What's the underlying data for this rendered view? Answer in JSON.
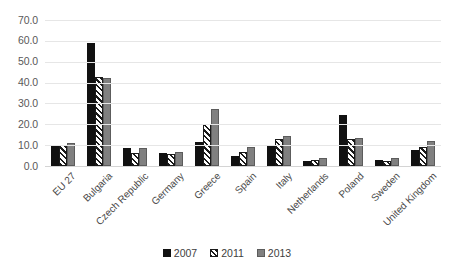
{
  "chart_data": {
    "type": "bar",
    "title": "",
    "subtitle": "",
    "xlabel": "",
    "ylabel": "",
    "ylim": [
      0,
      70
    ],
    "ytick_step": 10,
    "ytick_labels": [
      "70.0",
      "60.0",
      "50.0",
      "40.0",
      "30.0",
      "20.0",
      "10.0",
      "0.0"
    ],
    "grid": true,
    "legend_position": "bottom",
    "categories": [
      "EU 27",
      "Bulgaria",
      "Czech Republic",
      "Germany",
      "Greece",
      "Spain",
      "Italy",
      "Netherlands",
      "Poland",
      "Sweden",
      "United Kingdom"
    ],
    "series": [
      {
        "name": "2007",
        "color": "#111111",
        "pattern": "solid",
        "values": [
          10.3,
          58.8,
          8.5,
          6.4,
          11.5,
          5.0,
          10.0,
          2.4,
          24.5,
          3.0,
          7.5
        ]
      },
      {
        "name": "2011",
        "color": "#ffffff",
        "pattern": "diagonal-hatch",
        "values": [
          10.0,
          42.5,
          6.4,
          6.0,
          20.0,
          6.5,
          13.0,
          3.0,
          13.0,
          2.5,
          9.0
        ]
      },
      {
        "name": "2013",
        "color": "#808080",
        "pattern": "solid",
        "values": [
          11.2,
          42.4,
          8.5,
          6.5,
          27.5,
          9.0,
          14.5,
          4.0,
          13.5,
          4.0,
          12.0
        ]
      }
    ]
  },
  "legend": {
    "items": [
      {
        "label": "2007"
      },
      {
        "label": "2011"
      },
      {
        "label": "2013"
      }
    ]
  }
}
